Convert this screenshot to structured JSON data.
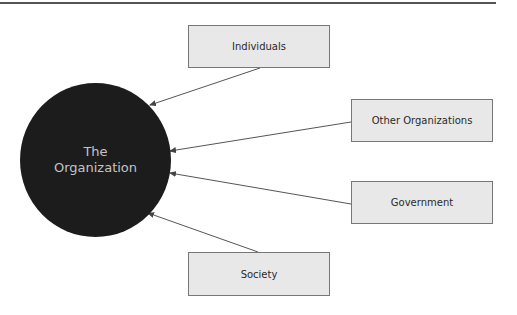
{
  "diagram": {
    "center": {
      "line1": "The",
      "line2": "Organization",
      "fill": "#1c1c1c",
      "text_color": "#c4c4c4"
    },
    "nodes": [
      {
        "id": "individuals",
        "label": "Individuals"
      },
      {
        "id": "other-organizations",
        "label": "Other Organizations"
      },
      {
        "id": "government",
        "label": "Government"
      },
      {
        "id": "society",
        "label": "Society"
      }
    ],
    "edges": [
      {
        "from": "individuals",
        "to": "the-organization"
      },
      {
        "from": "other-organizations",
        "to": "the-organization"
      },
      {
        "from": "government",
        "to": "the-organization"
      },
      {
        "from": "society",
        "to": "the-organization"
      }
    ],
    "box_fill": "#e8e8e8",
    "box_border": "#777777",
    "arrow_color": "#555555"
  }
}
